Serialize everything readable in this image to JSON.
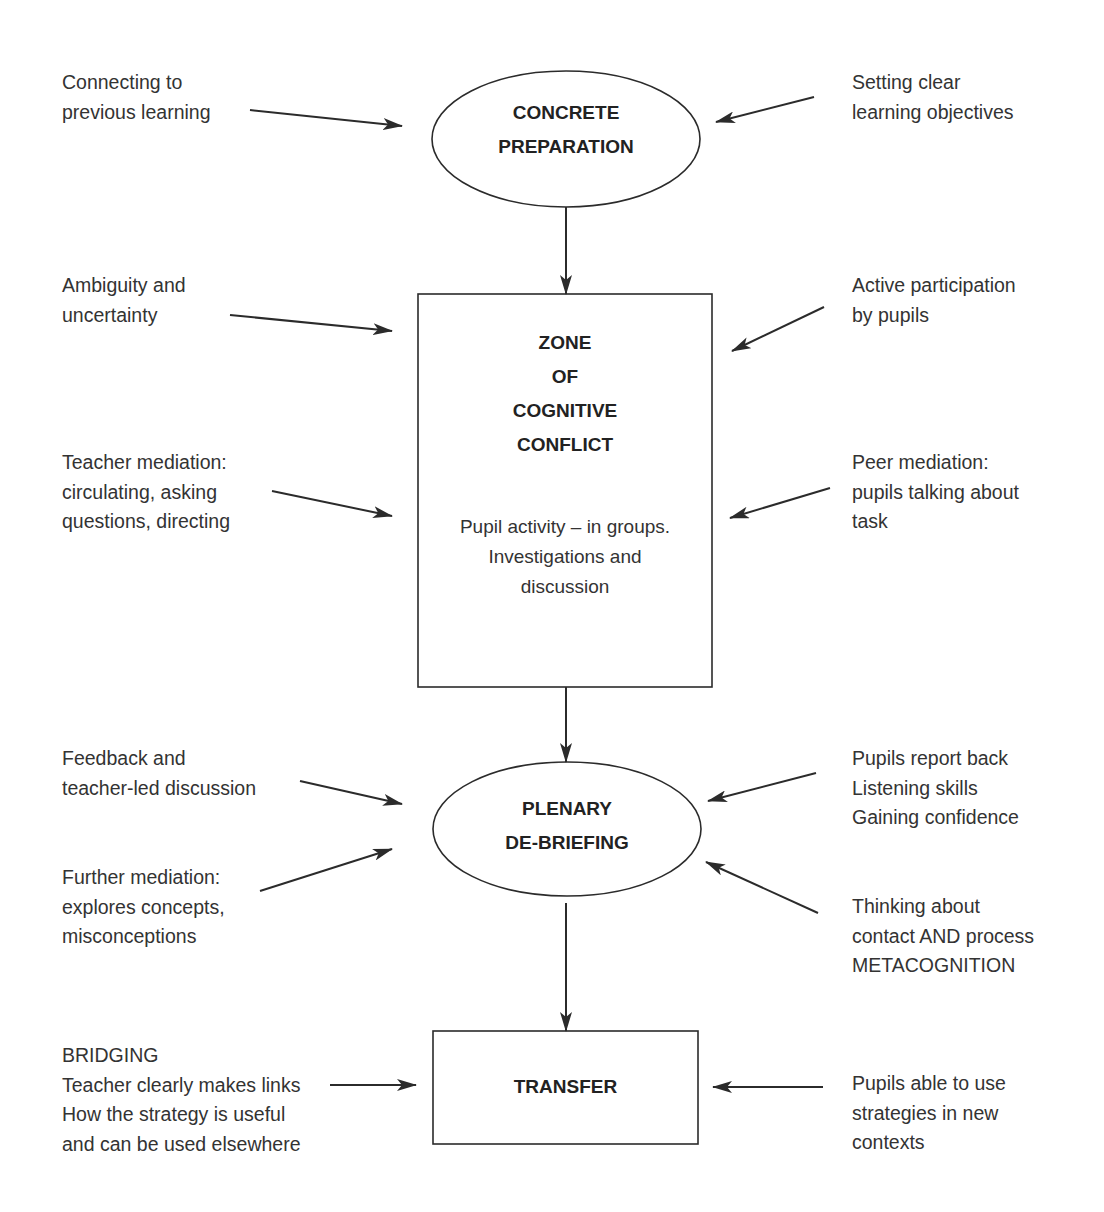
{
  "nodes": {
    "concrete_preparation": {
      "lines": [
        "CONCRETE",
        "PREPARATION"
      ]
    },
    "zone": {
      "title_lines": [
        "ZONE",
        "OF",
        "COGNITIVE",
        "CONFLICT"
      ],
      "body_lines": [
        "Pupil activity – in groups.",
        "Investigations and",
        "discussion"
      ]
    },
    "plenary": {
      "lines": [
        "PLENARY",
        "DE-BRIEFING"
      ]
    },
    "transfer": {
      "lines": [
        "TRANSFER"
      ]
    }
  },
  "notes": {
    "left": [
      {
        "id": "connecting",
        "lines": [
          "Connecting to",
          "previous learning"
        ]
      },
      {
        "id": "ambiguity",
        "lines": [
          "Ambiguity and",
          "uncertainty"
        ]
      },
      {
        "id": "teacher-mediation",
        "lines": [
          "Teacher mediation:",
          "circulating, asking",
          "questions, directing"
        ]
      },
      {
        "id": "feedback",
        "lines": [
          "Feedback and",
          "teacher-led discussion"
        ]
      },
      {
        "id": "further-mediation",
        "lines": [
          "Further mediation:",
          "explores concepts,",
          "misconceptions"
        ]
      },
      {
        "id": "bridging",
        "lines": [
          "BRIDGING",
          "Teacher clearly makes links",
          "How the strategy is useful",
          "and can be used elsewhere"
        ]
      }
    ],
    "right": [
      {
        "id": "objectives",
        "lines": [
          "Setting clear",
          "learning objectives"
        ]
      },
      {
        "id": "participation",
        "lines": [
          "Active participation",
          "by pupils"
        ]
      },
      {
        "id": "peer-mediation",
        "lines": [
          "Peer mediation:",
          "pupils talking about",
          "task"
        ]
      },
      {
        "id": "report-back",
        "lines": [
          "Pupils report back",
          "Listening skills",
          "Gaining confidence"
        ]
      },
      {
        "id": "thinking",
        "lines": [
          "Thinking about",
          "contact AND process",
          "METACOGNITION"
        ]
      },
      {
        "id": "pupils-able",
        "lines": [
          "Pupils able to use",
          "strategies in new",
          "contexts"
        ]
      }
    ]
  },
  "colors": {
    "stroke": "#2b2b2b",
    "text": "#333333",
    "background": "#ffffff"
  }
}
